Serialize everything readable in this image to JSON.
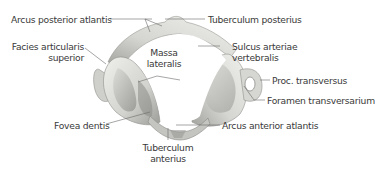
{
  "figure": {
    "colors": {
      "background": "#ffffff",
      "bone_light": "#e6e6e3",
      "bone_mid": "#c9c9c5",
      "bone_dark": "#8f8f8b",
      "label_text": "#3a3a3a",
      "leader_line": "#6a6a6a"
    },
    "labels": [
      {
        "id": "arcus-posterior-atlantis",
        "text": "Arcus posterior atlantis"
      },
      {
        "id": "tuberculum-posterius",
        "text": "Tuberculum posterius"
      },
      {
        "id": "facies-articularis-superior",
        "line1": "Facies articularis",
        "line2": "superior"
      },
      {
        "id": "massa-lateralis",
        "line1": "Massa",
        "line2": "lateralis"
      },
      {
        "id": "sulcus-arteriae-vertebralis",
        "line1": "Sulcus arteriae",
        "line2": "vertebralis"
      },
      {
        "id": "proc-transversus",
        "text": "Proc. transversus"
      },
      {
        "id": "foramen-transversarium",
        "text": "Foramen transversarium"
      },
      {
        "id": "fovea-dentis",
        "text": "Fovea dentis"
      },
      {
        "id": "arcus-anterior-atlantis",
        "text": "Arcus anterior atlantis"
      },
      {
        "id": "tuberculum-anterius",
        "line1": "Tuberculum",
        "line2": "anterius"
      }
    ]
  }
}
